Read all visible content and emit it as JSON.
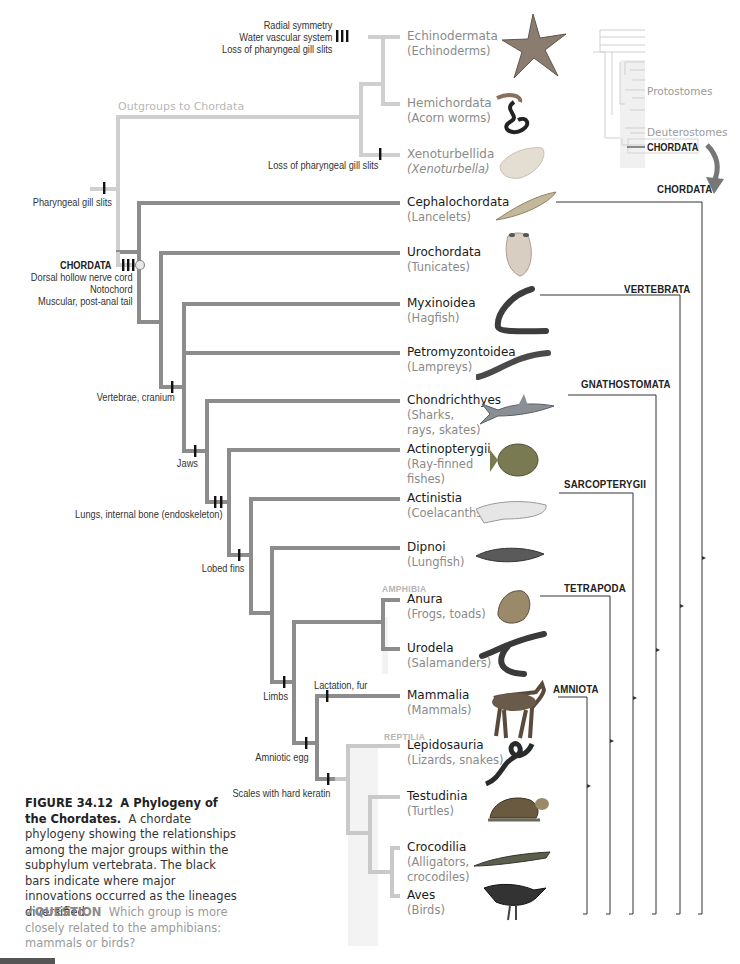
{
  "figure": {
    "number": "FIGURE 34.12",
    "title": "A Phylogeny of the Chordates.",
    "caption": "A chordate phylogeny showing the relationships among the major groups within the subphylum vertebrata. The black bars indicate where major innovations occurred as the lineages diversified.",
    "question_label": "QUESTION",
    "question_text": "Which group is more closely related to the amphibians: mammals or birds?"
  },
  "outgroup_label": "Outgroups to Chordata",
  "inset": {
    "protostomes": "Protostomes",
    "deuterostomes": "Deuterostomes",
    "chordata": "CHORDATA"
  },
  "taxa": [
    {
      "id": "echinodermata",
      "scientific": "Echinodermata",
      "common": "(Echinoderms)",
      "outgroup": true
    },
    {
      "id": "hemichordata",
      "scientific": "Hemichordata",
      "common": "(Acorn worms)",
      "outgroup": true
    },
    {
      "id": "xenoturbellida",
      "scientific": "Xenoturbellida",
      "common": "(Xenoturbella)",
      "outgroup": true
    },
    {
      "id": "cephalochordata",
      "scientific": "Cephalochordata",
      "common": "(Lancelets)"
    },
    {
      "id": "urochordata",
      "scientific": "Urochordata",
      "common": "(Tunicates)"
    },
    {
      "id": "myxinoidea",
      "scientific": "Myxinoidea",
      "common": "(Hagfish)"
    },
    {
      "id": "petromyzontoidea",
      "scientific": "Petromyzontoidea",
      "common": "(Lampreys)"
    },
    {
      "id": "chondrichthyes",
      "scientific": "Chondrichthyes",
      "common": "(Sharks, rays, skates)"
    },
    {
      "id": "actinopterygii",
      "scientific": "Actinopterygii",
      "common": "(Ray-finned fishes)"
    },
    {
      "id": "actinistia",
      "scientific": "Actinistia",
      "common": "(Coelacanths)"
    },
    {
      "id": "dipnoi",
      "scientific": "Dipnoi",
      "common": "(Lungfish)"
    },
    {
      "id": "anura",
      "scientific": "Anura",
      "common": "(Frogs, toads)"
    },
    {
      "id": "urodela",
      "scientific": "Urodela",
      "common": "(Salamanders)"
    },
    {
      "id": "mammalia",
      "scientific": "Mammalia",
      "common": "(Mammals)"
    },
    {
      "id": "lepidosauria",
      "scientific": "Lepidosauria",
      "common": "(Lizards, snakes)"
    },
    {
      "id": "testudinia",
      "scientific": "Testudinia",
      "common": "(Turtles)"
    },
    {
      "id": "crocodilia",
      "scientific": "Crocodilia",
      "common": "(Alligators, crocodiles)"
    },
    {
      "id": "aves",
      "scientific": "Aves",
      "common": "(Birds)"
    }
  ],
  "subgroups": {
    "amphibia": "AMPHIBIA",
    "reptilia": "REPTILIA"
  },
  "characters": {
    "echinoderm": [
      "Radial symmetry",
      "Water vascular system",
      "Loss of pharyngeal gill slits"
    ],
    "xeno": "Loss of pharyngeal gill slits",
    "pharyngeal": "Pharyngeal gill slits",
    "chordata_title": "CHORDATA",
    "chordata": [
      "Dorsal hollow nerve cord",
      "Notochord",
      "Muscular, post-anal tail"
    ],
    "vertebrae": "Vertebrae, cranium",
    "jaws": "Jaws",
    "lungs": "Lungs, internal bone (endoskeleton)",
    "lobed": "Lobed fins",
    "limbs": "Limbs",
    "amniotic": "Amniotic egg",
    "lactation": "Lactation, fur",
    "scales": "Scales with hard keratin"
  },
  "clades": [
    {
      "name": "CHORDATA"
    },
    {
      "name": "VERTEBRATA"
    },
    {
      "name": "GNATHOSTOMATA"
    },
    {
      "name": "SARCOPTERYGII"
    },
    {
      "name": "TETRAPODA"
    },
    {
      "name": "AMNIOTA"
    }
  ],
  "colors": {
    "chordate_branch": "#8c8c8c",
    "outgroup_branch": "#cfcfcf",
    "reptile_branch": "#c9c9c9",
    "reptile_fill": "#f3f3f3",
    "synapomorphy_bar": "#111111"
  }
}
